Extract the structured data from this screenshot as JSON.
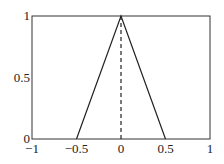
{
  "chart_data": {
    "type": "line",
    "title": "",
    "xlabel": "",
    "ylabel": "",
    "xlim": [
      -1,
      1
    ],
    "ylim": [
      0,
      1
    ],
    "grid": false,
    "legend": null,
    "x_ticks": [
      -1,
      -0.5,
      0,
      0.5,
      1
    ],
    "x_tick_labels": [
      "−1",
      "−0.5",
      "0",
      "0.5",
      "1"
    ],
    "y_ticks": [
      0,
      0.5,
      1
    ],
    "y_tick_labels": [
      "0",
      "0.5",
      "1"
    ],
    "series": [
      {
        "name": "triangle",
        "style": "solid",
        "color": "#222222",
        "x": [
          -0.5,
          0,
          0.5
        ],
        "y": [
          0,
          1,
          0
        ]
      },
      {
        "name": "center-line",
        "style": "dashed",
        "color": "#222222",
        "x": [
          0,
          0
        ],
        "y": [
          0,
          1
        ]
      }
    ]
  },
  "layout": {
    "plot_left": 32,
    "plot_right": 210,
    "plot_top": 16,
    "plot_bottom": 139
  }
}
